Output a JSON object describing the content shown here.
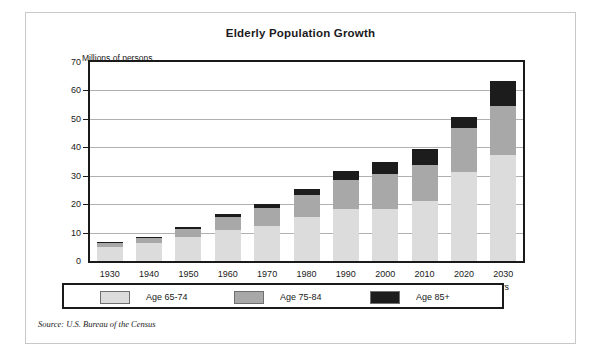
{
  "figure": {
    "title": "Elderly Population Growth",
    "source": "Source: U.S. Bureau of the Census"
  },
  "legend": {
    "items": [
      {
        "label": "Age 65-74",
        "color": "#dcdcdc"
      },
      {
        "label": "Age 75-84",
        "color": "#a8a8a8"
      },
      {
        "label": "Age 85+",
        "color": "#1c1c1c"
      }
    ]
  },
  "chart_data": {
    "type": "bar",
    "stacked": true,
    "title": "Elderly Population Growth",
    "xlabel": "Years",
    "ylabel": "Millions of persons",
    "ylim": [
      0,
      70
    ],
    "yticks": [
      0,
      10,
      20,
      30,
      40,
      50,
      60,
      70
    ],
    "grid": true,
    "legend_position": "bottom",
    "categories": [
      "1930",
      "1940",
      "1950",
      "1960",
      "1970",
      "1980",
      "1990",
      "2000",
      "2010",
      "2020",
      "2030"
    ],
    "series": [
      {
        "name": "Age 65-74",
        "color": "#dcdcdc",
        "values": [
          4.9,
          6.4,
          8.4,
          11.0,
          12.4,
          15.6,
          18.4,
          18.2,
          21.1,
          31.4,
          37.2
        ]
      },
      {
        "name": "Age 75-84",
        "color": "#a8a8a8",
        "values": [
          1.4,
          1.8,
          2.8,
          4.6,
          6.1,
          7.7,
          10.1,
          12.3,
          12.6,
          15.4,
          17.2
        ]
      },
      {
        "name": "Age 85+",
        "color": "#1c1c1c",
        "values": [
          0.3,
          0.4,
          0.6,
          0.9,
          1.4,
          2.2,
          3.0,
          4.3,
          5.7,
          3.8,
          9.1
        ]
      }
    ],
    "totals": [
      6.6,
      8.6,
      11.8,
      16.5,
      19.9,
      25.5,
      31.5,
      34.8,
      39.4,
      50.6,
      63.5
    ]
  }
}
